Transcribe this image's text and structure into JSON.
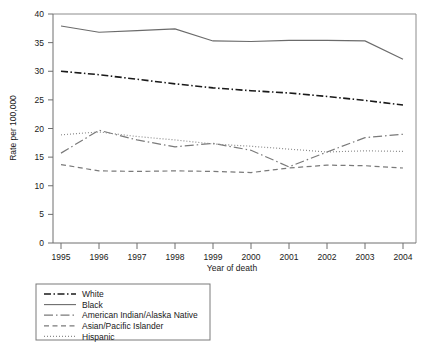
{
  "chart_data": {
    "type": "line",
    "title": "",
    "xlabel": "Year of death",
    "ylabel": "Rate per 100,000",
    "x": [
      1995,
      1996,
      1997,
      1998,
      1999,
      2000,
      2001,
      2002,
      2003,
      2004
    ],
    "xtick_labels": [
      "1995",
      "1996",
      "1997",
      "1998",
      "1999",
      "2000",
      "2001",
      "2002",
      "2003",
      "2004"
    ],
    "ytick_labels": [
      "0",
      "5",
      "10",
      "15",
      "20",
      "25",
      "30",
      "35",
      "40"
    ],
    "yticks": [
      0,
      5,
      10,
      15,
      20,
      25,
      30,
      35,
      40
    ],
    "ylim": [
      0,
      40
    ],
    "xlim": [
      1995,
      2004
    ],
    "grid": false,
    "legend_position": "below-left",
    "series": [
      {
        "name": "White",
        "values": [
          30.0,
          29.4,
          28.6,
          27.8,
          27.1,
          26.6,
          26.2,
          25.6,
          24.9,
          24.1
        ],
        "style": "dash-dot",
        "color": "#1a1a1a",
        "width": 1.6
      },
      {
        "name": "Black",
        "values": [
          37.9,
          36.8,
          37.1,
          37.4,
          35.3,
          35.2,
          35.4,
          35.4,
          35.3,
          32.1
        ],
        "style": "solid",
        "color": "#6b6b6b",
        "width": 1.1
      },
      {
        "name": "American Indian/Alaska Native",
        "values": [
          15.7,
          19.7,
          18.0,
          16.8,
          17.4,
          16.2,
          13.3,
          15.9,
          18.4,
          19.0
        ],
        "style": "long-dash-dot",
        "color": "#7a7a7a",
        "width": 1.2
      },
      {
        "name": "Asian/Pacific Islander",
        "values": [
          13.7,
          12.6,
          12.5,
          12.6,
          12.5,
          12.3,
          13.1,
          13.6,
          13.5,
          13.1
        ],
        "style": "dashed",
        "color": "#7a7a7a",
        "width": 1.2
      },
      {
        "name": "Hispanic",
        "values": [
          18.9,
          19.4,
          18.6,
          18.0,
          17.3,
          16.9,
          16.4,
          15.9,
          16.1,
          16.0
        ],
        "style": "dotted",
        "color": "#8c8c8c",
        "width": 1.2
      }
    ]
  },
  "legend": {
    "items": [
      {
        "label": "White"
      },
      {
        "label": "Black"
      },
      {
        "label": "American Indian/Alaska Native"
      },
      {
        "label": "Asian/Pacific Islander"
      },
      {
        "label": "Hispanic"
      }
    ]
  }
}
